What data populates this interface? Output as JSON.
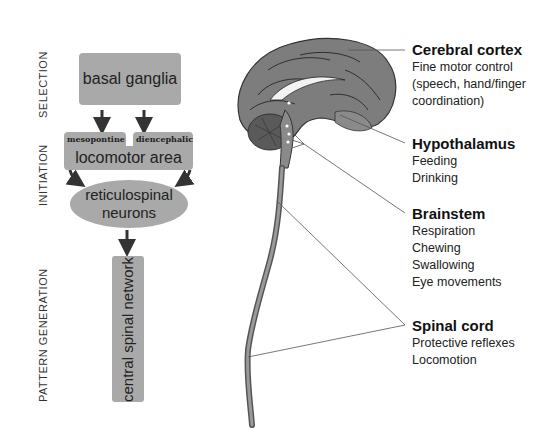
{
  "stages": {
    "selection": "SELECTION",
    "initiation": "INITIATION",
    "pattern_generation": "PATTERN GENERATION"
  },
  "flowchart": {
    "basal_ganglia": "basal ganglia",
    "mesopontine": "mesopontine",
    "diencephalic": "diencephalic",
    "locomotor_area": "locomotor area",
    "reticulospinal_line1": "reticulospinal",
    "reticulospinal_line2": "neurons",
    "central_spinal_network": "central spinal network"
  },
  "regions": [
    {
      "title": "Cerebral cortex",
      "items": [
        "Fine motor control",
        "(speech, hand/finger",
        "coordination)"
      ]
    },
    {
      "title": "Hypothalamus",
      "items": [
        "Feeding",
        "Drinking"
      ]
    },
    {
      "title": "Brainstem",
      "items": [
        "Respiration",
        "Chewing",
        "Swallowing",
        "Eye movements"
      ]
    },
    {
      "title": "Spinal cord",
      "items": [
        "Protective reflexes",
        "Locomotion"
      ]
    }
  ],
  "colors": {
    "box_fill": "#a9a9a9",
    "arrow": "#333333",
    "brain_fill": "#7d7d7d",
    "leader_line": "#555555"
  }
}
